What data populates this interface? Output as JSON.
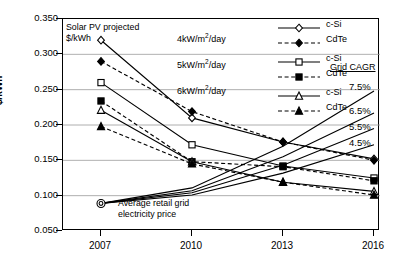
{
  "axes": {
    "ylabel": "$/kWh",
    "yticks": [
      "0.350",
      "0.300",
      "0.250",
      "0.200",
      "0.150",
      "0.100",
      "0.050"
    ],
    "xticks": [
      "2007",
      "2010",
      "2013",
      "2016"
    ]
  },
  "annotations": {
    "title_line1": "Solar PV projected",
    "title_line2": "$/kWh",
    "grid_line1": "Average retail grid",
    "grid_line2": "electricity price",
    "cagr_header": "Grid CAGR"
  },
  "irradiance": [
    {
      "value": "4",
      "unit_pre": "kW/m",
      "unit_sup": "2",
      "unit_post": "/day"
    },
    {
      "value": "5",
      "unit_pre": "kW/m",
      "unit_sup": "2",
      "unit_post": "/day"
    },
    {
      "value": "6",
      "unit_pre": "kW/m",
      "unit_sup": "2",
      "unit_post": "/day"
    }
  ],
  "legend": [
    {
      "label": "c-Si",
      "marker": "open-diamond",
      "style": "solid"
    },
    {
      "label": "CdTe",
      "marker": "filled-diamond",
      "style": "dashed"
    },
    {
      "label": "c-Si",
      "marker": "open-square",
      "style": "solid"
    },
    {
      "label": "CdTe",
      "marker": "filled-square",
      "style": "dashed"
    },
    {
      "label": "c-Si",
      "marker": "open-triangle",
      "style": "solid"
    },
    {
      "label": "CdTe",
      "marker": "filled-triangle",
      "style": "dashed"
    }
  ],
  "cagr_labels": [
    "7.5%",
    "6.5%",
    "5.5%",
    "4.5%"
  ],
  "chart_data": {
    "type": "line",
    "title": "Solar PV projected $/kWh",
    "xlabel": "",
    "ylabel": "$/kWh",
    "x": [
      2007,
      2010,
      2013,
      2016
    ],
    "ylim": [
      0.05,
      0.35
    ],
    "ytick_step": 0.05,
    "grid": true,
    "legend_position": "top-right",
    "series": [
      {
        "name": "4kW/m2/day c-Si",
        "marker": "open-diamond",
        "style": "solid",
        "values": [
          0.32,
          0.21,
          0.176,
          0.152
        ]
      },
      {
        "name": "4kW/m2/day CdTe",
        "marker": "filled-diamond",
        "style": "dashed",
        "values": [
          0.29,
          0.219,
          0.176,
          0.15
        ]
      },
      {
        "name": "5kW/m2/day c-Si",
        "marker": "open-square",
        "style": "solid",
        "values": [
          0.26,
          0.172,
          0.142,
          0.125
        ]
      },
      {
        "name": "5kW/m2/day CdTe",
        "marker": "filled-square",
        "style": "dashed",
        "values": [
          0.234,
          0.148,
          0.141,
          0.121
        ]
      },
      {
        "name": "6kW/m2/day c-Si",
        "marker": "open-triangle",
        "style": "solid",
        "values": [
          0.221,
          0.148,
          0.119,
          0.106
        ]
      },
      {
        "name": "6kW/m2/day CdTe",
        "marker": "filled-triangle",
        "style": "dashed",
        "values": [
          0.198,
          0.145,
          0.119,
          0.101
        ]
      },
      {
        "name": "Grid CAGR 7.5%",
        "marker": "none",
        "style": "solid",
        "values": [
          0.089,
          0.111,
          0.17,
          0.248
        ]
      },
      {
        "name": "Grid CAGR 6.5%",
        "marker": "none",
        "style": "solid",
        "values": [
          0.089,
          0.107,
          0.155,
          0.217
        ]
      },
      {
        "name": "Grid CAGR 5.5%",
        "marker": "none",
        "style": "solid",
        "values": [
          0.089,
          0.104,
          0.143,
          0.195
        ]
      },
      {
        "name": "Grid CAGR 4.5%",
        "marker": "none",
        "style": "solid",
        "values": [
          0.089,
          0.101,
          0.132,
          0.172
        ]
      }
    ],
    "annotations": [
      {
        "text": "Average retail grid electricity price",
        "x": 2007,
        "y": 0.089
      },
      {
        "text": "Grid CAGR",
        "x": 2016,
        "y": 0.3
      }
    ]
  }
}
